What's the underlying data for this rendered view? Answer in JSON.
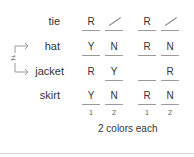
{
  "rows": [
    {
      "label": "tie",
      "cells": [
        "R",
        "/",
        "R",
        "/"
      ],
      "underlined": [
        true,
        true,
        true,
        true
      ]
    },
    {
      "label": "hat",
      "cells": [
        "Y",
        "N",
        "R",
        "N"
      ],
      "underlined": [
        true,
        true,
        true,
        true
      ]
    },
    {
      "label": "jacket",
      "cells": [
        "R",
        "Y",
        "",
        "R"
      ],
      "underlined": [
        false,
        true,
        true,
        true
      ]
    },
    {
      "label": "skirt",
      "cells": [
        "Y",
        "N",
        "R",
        "N"
      ],
      "underlined": [
        true,
        true,
        true,
        true
      ]
    }
  ],
  "column_numbers": [
    "1",
    "2",
    "1",
    "2"
  ],
  "caption": "2 colors each",
  "not_equal_symbol": "≠",
  "icons": {
    "arrow_to_hat": "arrow-right-icon",
    "arrow_to_jacket": "arrow-right-icon"
  }
}
